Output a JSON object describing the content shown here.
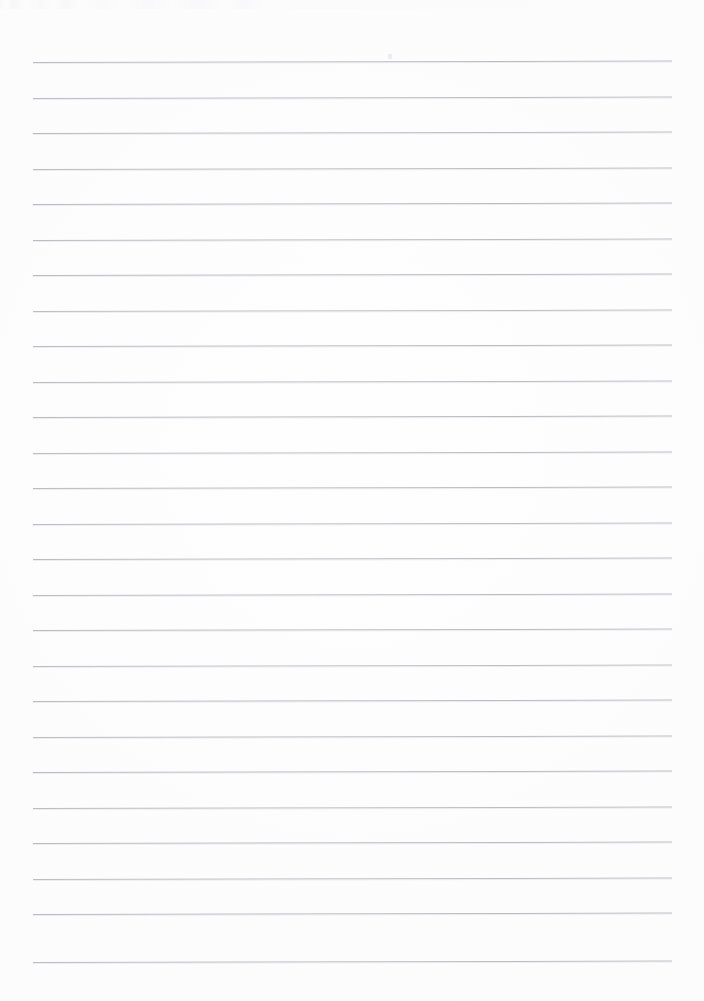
{
  "document": {
    "kind": "scanned-lined-notebook-page",
    "title": "Blank ruled notebook page",
    "content_text": "",
    "page_width": 704,
    "page_height": 1001,
    "background_color": "#fefefe",
    "has_handwriting": false,
    "has_header": false,
    "has_footer": false,
    "has_margin_rule": false,
    "orientation": "portrait"
  },
  "ruling": {
    "line_color": "#b6b6bb",
    "line_shadow_color": "#dddde1",
    "line_thickness_px": 1,
    "line_count": 26,
    "line_left_x": 33,
    "line_right_x": 672,
    "line_length_px": 639,
    "first_line_y": 62,
    "line_spacing_px": 35.5,
    "skew_degrees": -0.13,
    "style": "wide-ruled"
  },
  "artifacts": {
    "scan_noise_top_edge": true,
    "speck_x": 388,
    "speck_y": 54,
    "vignette": true
  },
  "lines": [
    {
      "index": 1,
      "y": 62,
      "opacity": 0.92
    },
    {
      "index": 2,
      "y": 97.5,
      "opacity": 0.9
    },
    {
      "index": 3,
      "y": 133,
      "opacity": 0.92
    },
    {
      "index": 4,
      "y": 168.5,
      "opacity": 0.9
    },
    {
      "index": 5,
      "y": 204,
      "opacity": 0.93
    },
    {
      "index": 6,
      "y": 239.5,
      "opacity": 0.9
    },
    {
      "index": 7,
      "y": 275,
      "opacity": 0.92
    },
    {
      "index": 8,
      "y": 310.5,
      "opacity": 0.88
    },
    {
      "index": 9,
      "y": 346,
      "opacity": 0.92
    },
    {
      "index": 10,
      "y": 381.5,
      "opacity": 0.9
    },
    {
      "index": 11,
      "y": 417,
      "opacity": 0.93
    },
    {
      "index": 12,
      "y": 452.5,
      "opacity": 0.9
    },
    {
      "index": 13,
      "y": 488,
      "opacity": 0.92
    },
    {
      "index": 14,
      "y": 523.5,
      "opacity": 0.89
    },
    {
      "index": 15,
      "y": 559,
      "opacity": 0.92
    },
    {
      "index": 16,
      "y": 594.5,
      "opacity": 0.9
    },
    {
      "index": 17,
      "y": 630,
      "opacity": 0.92
    },
    {
      "index": 18,
      "y": 665.5,
      "opacity": 0.88
    },
    {
      "index": 19,
      "y": 701,
      "opacity": 0.92
    },
    {
      "index": 20,
      "y": 736.5,
      "opacity": 0.9
    },
    {
      "index": 21,
      "y": 772,
      "opacity": 0.93
    },
    {
      "index": 22,
      "y": 807.5,
      "opacity": 0.9
    },
    {
      "index": 23,
      "y": 843,
      "opacity": 0.92
    },
    {
      "index": 24,
      "y": 878.5,
      "opacity": 0.9
    },
    {
      "index": 25,
      "y": 914,
      "opacity": 0.92
    },
    {
      "index": 26,
      "y": 962,
      "opacity": 0.9
    }
  ]
}
